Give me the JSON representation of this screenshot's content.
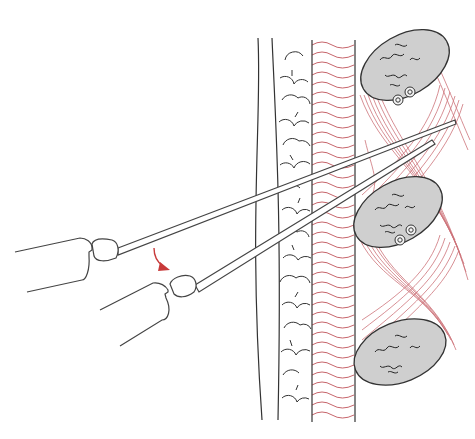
{
  "figure": {
    "type": "anatomical-illustration",
    "text_labels": [],
    "colors": {
      "background": "#ffffff",
      "outline": "#3a3a3a",
      "tissue_red": "#c0545a",
      "muscle_red": "#c45a62",
      "bone_fill": "#cfcfcf",
      "arrow": "#c83a3a"
    },
    "layers": [
      {
        "name": "skin",
        "x_range": [
          255,
          275
        ]
      },
      {
        "name": "subcutaneous-fat",
        "x_range": [
          275,
          312
        ]
      },
      {
        "name": "fascia-dermis",
        "x_range": [
          312,
          355
        ]
      },
      {
        "name": "muscle",
        "x_range": [
          355,
          470
        ]
      }
    ],
    "bones": [
      {
        "name": "upper",
        "cx": 405,
        "cy": 65,
        "rx": 48,
        "ry": 30,
        "rotate": -30
      },
      {
        "name": "middle",
        "cx": 398,
        "cy": 212,
        "rx": 48,
        "ry": 30,
        "rotate": -30
      },
      {
        "name": "lower",
        "cx": 400,
        "cy": 352,
        "rx": 48,
        "ry": 30,
        "rotate": -22
      }
    ],
    "needles": [
      {
        "name": "upper-needle",
        "from": [
          105,
          243
        ],
        "to": [
          455,
          120
        ]
      },
      {
        "name": "lower-needle",
        "from": [
          190,
          282
        ],
        "to": [
          430,
          140
        ]
      }
    ],
    "arrow": {
      "name": "rotation-arrow",
      "x": 158,
      "y": 250
    }
  }
}
